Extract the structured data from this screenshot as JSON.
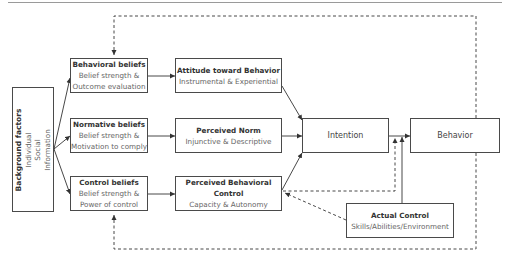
{
  "diagram": {
    "background_factors": {
      "title": "Background factors",
      "items": [
        "Individual",
        "Social",
        "Information"
      ]
    },
    "beliefs": [
      {
        "title": "Behavioral beliefs",
        "line1": "Belief strength &",
        "line2": "Outcome evaluation"
      },
      {
        "title": "Normative beliefs",
        "line1": "Belief strength &",
        "line2": "Motivation to comply"
      },
      {
        "title": "Control beliefs",
        "line1": "Belief strength &",
        "line2": "Power of control"
      }
    ],
    "determinants": [
      {
        "title": "Attitude toward Behavior",
        "sub": "Instrumental & Experiential"
      },
      {
        "title": "Perceived Norm",
        "sub": "Injunctive & Descriptive"
      },
      {
        "title": "Perceived Behavioral",
        "title2": "Control",
        "sub": "Capacity & Autonomy"
      }
    ],
    "intention": {
      "label": "Intention"
    },
    "behavior": {
      "label": "Behavior"
    },
    "actual_control": {
      "title": "Actual Control",
      "sub": "Skills/Abilities/Environment"
    },
    "colors": {
      "line": "#333333",
      "box_border": "#4a4a4a",
      "text_dark": "#333333",
      "text_sub": "#666666"
    }
  }
}
